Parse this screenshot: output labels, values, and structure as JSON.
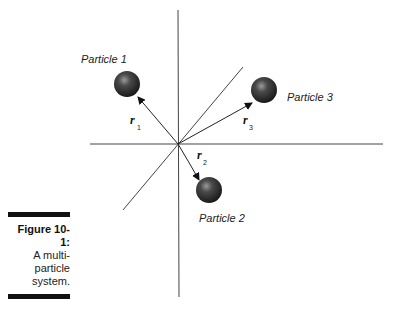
{
  "figure": {
    "number_label": "Figure 10-1:",
    "caption_lines": [
      "A multi-",
      "particle",
      "system."
    ]
  },
  "diagram": {
    "particles": [
      {
        "label": "Particle 1",
        "vector": "r",
        "subscript": "1"
      },
      {
        "label": "Particle 2",
        "vector": "r",
        "subscript": "2"
      },
      {
        "label": "Particle 3",
        "vector": "r",
        "subscript": "3"
      }
    ],
    "colors": {
      "axis": "#444444",
      "sphere": "#3a3a3a",
      "text": "#222222"
    }
  }
}
